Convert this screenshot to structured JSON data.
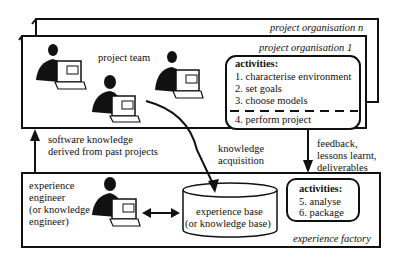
{
  "organisations": {
    "outer_label": "project organisation n",
    "inner_label": "project organisation 1"
  },
  "project_team": {
    "label": "project team"
  },
  "project_activities": {
    "title": "activities:",
    "items": [
      "1. characterise environment",
      "2. set goals",
      "3. choose models"
    ],
    "after_divider": "4. perform project"
  },
  "arrows": {
    "up_label_line1": "software knowledge",
    "up_label_line2": "derived from past projects",
    "acquisition_line1": "knowledge",
    "acquisition_line2": "acquisition",
    "feedback_line1": "feedback,",
    "feedback_line2": "lessons learnt,",
    "feedback_line3": "deliverables"
  },
  "experience_factory": {
    "label": "experience factory",
    "engineer_lines": [
      "experience",
      "engineer",
      "(or knowledge",
      "engineer)"
    ],
    "base_line1": "experience base",
    "base_line2": "(or knowledge base)",
    "activities_title": "activities:",
    "activities_items": [
      "5. analyse",
      "6. package"
    ]
  }
}
